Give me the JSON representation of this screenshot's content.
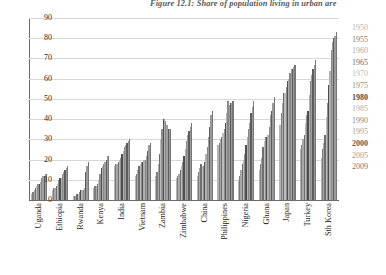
{
  "figure": {
    "title": "Figure 12.1: Share of population living in urban are",
    "title_full_truncated": true
  },
  "chart_data": {
    "type": "bar",
    "title": "Figure 12.1: Share of population living in urban are",
    "xlabel": "",
    "ylabel": "",
    "ylim": [
      0,
      90
    ],
    "yticks": [
      0,
      10,
      20,
      30,
      40,
      50,
      60,
      70,
      80,
      90
    ],
    "ytick_labels": [
      "0",
      "10",
      "20",
      "30",
      "40",
      "50",
      "60",
      "70",
      "80",
      "90"
    ],
    "grid": true,
    "legend_position": "right",
    "legend_title": "",
    "categories": [
      "Uganda",
      "Ethiopia",
      "Rwanda",
      "Kenya",
      "India",
      "Vietnam",
      "Zambia",
      "Zimbabwe",
      "China",
      "Philippines",
      "Nigeria",
      "Ghana",
      "Japan",
      "Turkey",
      "Sth Korea"
    ],
    "series": [
      {
        "name": "1950",
        "color": "#b4b4b4",
        "values": [
          3,
          5,
          2,
          6,
          17,
          12,
          12,
          11,
          12,
          27,
          10,
          15,
          37,
          25,
          21
        ]
      },
      {
        "name": "1955",
        "color": "#7d7d7d",
        "values": [
          4,
          6,
          2,
          7,
          18,
          13,
          14,
          12,
          14,
          28,
          12,
          18,
          43,
          27,
          25
        ]
      },
      {
        "name": "1960",
        "color": "#a8a8a8",
        "values": [
          5,
          6,
          2,
          7,
          18,
          15,
          18,
          13,
          16,
          30,
          15,
          21,
          48,
          30,
          28
        ]
      },
      {
        "name": "1965",
        "color": "#6e6e6e",
        "values": [
          6,
          7,
          3,
          8,
          19,
          17,
          23,
          15,
          18,
          31,
          18,
          26,
          53,
          32,
          32
        ]
      },
      {
        "name": "1970",
        "color": "#bdbdbd",
        "values": [
          7,
          8,
          3,
          10,
          20,
          18,
          30,
          17,
          17,
          33,
          20,
          29,
          53,
          38,
          41
        ]
      },
      {
        "name": "1975",
        "color": "#8f8f8f",
        "values": [
          8,
          10,
          4,
          13,
          21,
          19,
          35,
          19,
          17,
          35,
          23,
          31,
          56,
          42,
          48
        ]
      },
      {
        "name": "1980",
        "color": "#4f4f4f",
        "values": [
          8,
          11,
          5,
          16,
          23,
          19,
          40,
          22,
          19,
          38,
          27,
          31,
          59,
          44,
          57
        ]
      },
      {
        "name": "1985",
        "color": "#b0b0b0",
        "values": [
          9,
          11,
          5,
          17,
          24,
          20,
          40,
          25,
          23,
          43,
          31,
          32,
          60,
          52,
          64
        ]
      },
      {
        "name": "1990",
        "color": "#888888",
        "values": [
          11,
          13,
          5,
          18,
          26,
          20,
          39,
          29,
          26,
          49,
          35,
          36,
          63,
          59,
          74
        ]
      },
      {
        "name": "1995",
        "color": "#a0a0a0",
        "values": [
          12,
          14,
          6,
          19,
          27,
          22,
          37,
          32,
          31,
          47,
          38,
          42,
          65,
          62,
          78
        ]
      },
      {
        "name": "2000",
        "color": "#5c5c5c",
        "values": [
          12,
          15,
          14,
          20,
          28,
          24,
          35,
          34,
          36,
          48,
          43,
          44,
          65,
          65,
          80
        ]
      },
      {
        "name": "2005",
        "color": "#9a9a9a",
        "values": [
          13,
          16,
          17,
          22,
          29,
          27,
          35,
          36,
          42,
          48,
          46,
          48,
          66,
          67,
          81
        ]
      },
      {
        "name": "2009",
        "color": "#767676",
        "values": [
          13,
          17,
          19,
          22,
          30,
          28,
          35,
          38,
          44,
          49,
          49,
          51,
          67,
          69,
          83
        ]
      }
    ]
  },
  "axis": {
    "y_max_label": "90",
    "y_min_label": "0"
  }
}
